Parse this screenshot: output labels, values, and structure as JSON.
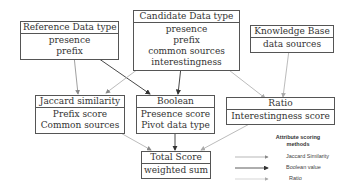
{
  "diagram": {
    "nodes": {
      "reference": {
        "title": "Reference Data type",
        "lines": [
          "presence",
          "prefix"
        ]
      },
      "candidate": {
        "title": "Candidate Data type",
        "lines": [
          "presence",
          "prefix",
          "common sources",
          "interestingness"
        ]
      },
      "knowledge": {
        "title": "Knowledge Base",
        "lines": [
          "data sources"
        ]
      },
      "jaccard": {
        "title": "Jaccard similarity",
        "lines": [
          "Prefix score",
          "Common sources"
        ]
      },
      "boolean": {
        "title": "Boolean",
        "lines": [
          "Presence score",
          "Pivot data type"
        ]
      },
      "ratio": {
        "title": "Ratio",
        "lines": [
          "Interestingness score"
        ]
      },
      "total": {
        "title": "Total Score",
        "lines": [
          "weighted sum"
        ]
      }
    },
    "edges": [
      {
        "from": "reference",
        "to": "jaccard",
        "method": "Jaccard Similarity"
      },
      {
        "from": "reference",
        "to": "boolean",
        "method": "Boolean value"
      },
      {
        "from": "candidate",
        "to": "jaccard",
        "method": "Jaccard Similarity"
      },
      {
        "from": "candidate",
        "to": "boolean",
        "method": "Boolean value"
      },
      {
        "from": "candidate",
        "to": "ratio",
        "method": "Ratio"
      },
      {
        "from": "knowledge",
        "to": "ratio",
        "method": "Ratio"
      },
      {
        "from": "jaccard",
        "to": "total",
        "method": "Jaccard Similarity"
      },
      {
        "from": "boolean",
        "to": "total",
        "method": "Boolean value"
      },
      {
        "from": "ratio",
        "to": "total",
        "method": "Ratio"
      }
    ],
    "legend": {
      "title_line1": "Attribute scoring",
      "title_line2": "methods",
      "items": [
        {
          "label": "Jaccard Similarity",
          "color": "#888888"
        },
        {
          "label": "Boolean value",
          "color": "#333333"
        },
        {
          "label": "Ratio",
          "color": "#b0b0b0"
        }
      ]
    }
  }
}
